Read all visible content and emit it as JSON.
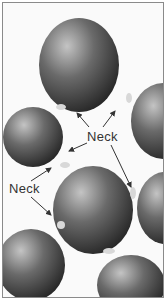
{
  "diagram": {
    "type": "sintered-particles",
    "labels": [
      {
        "text": "Neck",
        "x": 84,
        "y": 128
      },
      {
        "text": "Neck",
        "x": 8,
        "y": 180
      }
    ],
    "colors": {
      "particle_light": "#b8b8b8",
      "particle_dark": "#2e2e2e",
      "neck": "#d8d8d8",
      "background": "#fafafa",
      "border": "#8a8a8a",
      "arrow": "#333333"
    }
  }
}
